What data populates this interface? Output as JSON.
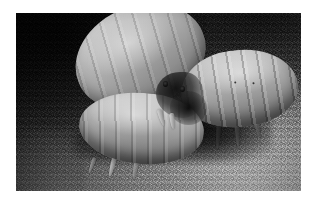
{
  "page": {
    "background_color": "#ffffff",
    "width": 316,
    "height": 203
  },
  "photograph": {
    "title": "Three pale beetle grubs on granular sand",
    "description": "Close-up grayscale macro photograph showing three cream-colored, segmented scarab beetle larvae (grubs) resting on coarse dark sand. One large grub lies across the upper-left, a second segmented grub occupies the right side with its legs and mandibles extended, and a third grub lies in the lower-left foreground. Deep shadow pools between and beneath the bodies.",
    "medium": "photograph",
    "color_mode": "grayscale",
    "frame": {
      "style": "white-border",
      "border_color": "#ffffff",
      "left": 16,
      "top": 13,
      "width": 285,
      "height": 178
    },
    "palette": {
      "sand_dark": "#232323",
      "sand_mid": "#5e5e5e",
      "sand_light": "#9a9a9a",
      "grub_highlight": "#dcd8d1",
      "grub_midtone": "#a8a29a",
      "grub_shadow": "#67635c",
      "deep_shadow": "#0c0b0a"
    },
    "subjects": [
      {
        "id": "grub-upper",
        "label": "Upper-left grub",
        "position": "upper-left",
        "orientation": "tilted up toward the right",
        "features": "plump segmented abdomen with bright specular highlight near the center"
      },
      {
        "id": "grub-right",
        "label": "Right grub",
        "position": "right",
        "orientation": "horizontal, head toward the left",
        "features": "clearly banded abdominal segments, dark spiracle dots, pale legs hanging into shadow"
      },
      {
        "id": "grub-lower",
        "label": "Lower-left grub",
        "position": "lower-left foreground",
        "orientation": "horizontal, head toward the right",
        "features": "smooth pale body with soft segment creases and legs trailing into the sand"
      }
    ],
    "head_cluster": {
      "label": "Head and mandible region",
      "description": "Dark head capsule with two small eye spots and crossing mandibles where the grubs meet near the image center"
    },
    "substrate": {
      "label": "Sand substrate",
      "description": "Coarse granular sand, dark in the upper-left and brighter toward the lower-right"
    }
  }
}
